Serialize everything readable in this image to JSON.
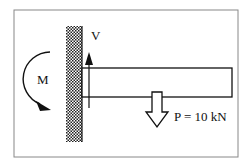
{
  "diagram": {
    "type": "cantilever-beam-free-body",
    "labels": {
      "moment": "M",
      "shear": "V",
      "load": "P = 10 kN"
    },
    "colors": {
      "line": "#111111",
      "frame": "#888888",
      "background": "#ffffff"
    }
  }
}
